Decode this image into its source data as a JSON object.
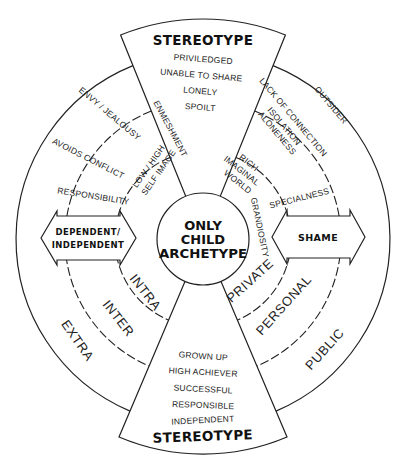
{
  "diagram": {
    "center_title": [
      "ONLY",
      "CHILD",
      "ARCHETYPE"
    ],
    "top_wedge": {
      "title": "STEREOTYPE",
      "items": [
        "PRIVILEDGED",
        "UNABLE TO SHARE",
        "LONELY",
        "SPOILT"
      ]
    },
    "bottom_wedge": {
      "title": "STEREOTYPE",
      "items": [
        "GROWN UP",
        "HIGH ACHIEVER",
        "SUCCESSFUL",
        "RESPONSIBLE",
        "INDEPENDENT"
      ]
    },
    "left_arrow": {
      "lines": [
        "DEPENDENT/",
        "INDEPENDENT"
      ]
    },
    "right_arrow": {
      "label": "SHAME"
    },
    "left_side": {
      "ring_labels": {
        "inner": "INTRA",
        "middle": "INTER",
        "outer": "EXTRA"
      },
      "inner_items": [
        "ENMESHMENT",
        "LOW / HIGH",
        "SELF IMAGE"
      ],
      "middle_items": [
        "ENVY / JEALOUSY",
        "AVOIDS CONFLICT",
        "RESPONSIBILITY"
      ]
    },
    "right_side": {
      "ring_labels": {
        "inner": "PRIVATE",
        "middle": "PERSONAL",
        "outer": "PUBLIC"
      },
      "inner_items": [
        "RICH",
        "IMAGINAL",
        "WORLD",
        "GRANDIOSITY"
      ],
      "middle_items": [
        "LACK OF CONNECTION",
        "ISOLATION",
        "ALONENESS",
        "SPECIALNESS"
      ],
      "outer_items": [
        "OUTSIDER"
      ]
    },
    "colors": {
      "line": "#222222",
      "background": "#ffffff"
    }
  }
}
